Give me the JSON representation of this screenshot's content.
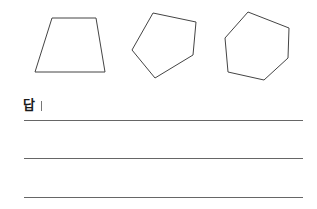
{
  "shapes": [
    {
      "name": "trapezoid",
      "sides": 4,
      "points": "52,18 96,18 105,72 35,72",
      "stroke": "#444444"
    },
    {
      "name": "pentagon",
      "sides": 5,
      "points": "153,13 196,22 193,55 155,78 132,50",
      "stroke": "#444444"
    },
    {
      "name": "hexagon",
      "sides": 6,
      "points": "248,12 289,28 288,58 264,80 228,72 225,38",
      "stroke": "#444444"
    }
  ],
  "answer": {
    "label": "답",
    "lines": [
      {
        "y": 120
      },
      {
        "y": 158
      },
      {
        "y": 197
      }
    ]
  }
}
